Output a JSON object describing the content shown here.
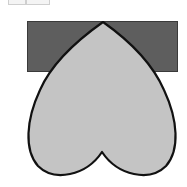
{
  "figure": {
    "colors": {
      "background": "#ffffff",
      "rectangle_fill": "#5e5e5e",
      "rectangle_stroke": "#3a3a3a",
      "heart_fill": "#c4c4c4",
      "heart_stroke": "#111111",
      "faint_outline": "#cfcfcf"
    },
    "shapes": [
      {
        "name": "rectangle",
        "x": 27,
        "y": 21,
        "width": 151,
        "height": 51
      },
      {
        "name": "inverted-heart",
        "apex": [
          103,
          22
        ],
        "notch": [
          102,
          152
        ],
        "left": 27,
        "right": 176,
        "bottom": 176
      }
    ]
  }
}
